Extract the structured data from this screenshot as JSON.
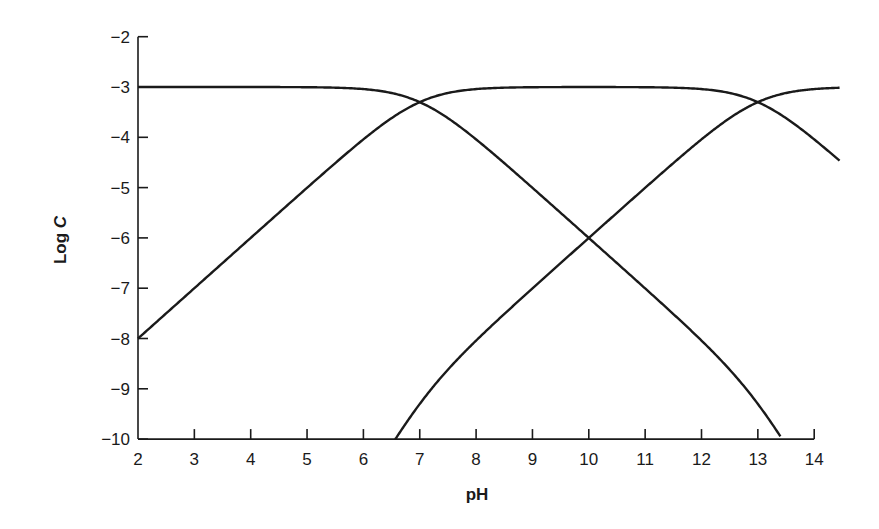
{
  "chart_data": {
    "type": "line",
    "title": "",
    "xlabel": "pH",
    "ylabel": "Log C",
    "ylabel_parts": {
      "plain": "Log ",
      "italic": "C"
    },
    "xlim": [
      2,
      14.45
    ],
    "ylim": [
      -10,
      -2
    ],
    "x_ticks": [
      2,
      3,
      4,
      5,
      6,
      7,
      8,
      9,
      10,
      11,
      12,
      13,
      14
    ],
    "x_tick_labels": [
      "2",
      "3",
      "4",
      "5",
      "6",
      "7",
      "8",
      "9",
      "10",
      "11",
      "12",
      "13",
      "14"
    ],
    "y_ticks": [
      -2,
      -3,
      -4,
      -5,
      -6,
      -7,
      -8,
      -9,
      -10
    ],
    "y_tick_labels": [
      "−2",
      "−3",
      "−4",
      "−5",
      "−6",
      "−7",
      "−8",
      "−9",
      "−10"
    ],
    "grid": false,
    "legend": null,
    "model": {
      "log_total_concentration": -3,
      "pKa1": 7,
      "pKa2": 13
    },
    "series": [
      {
        "name": "H2A (fully protonated)",
        "x": [
          2,
          4,
          5,
          6,
          6.5,
          7,
          7.5,
          8,
          9,
          10,
          11,
          12,
          12.5,
          13,
          13.4
        ],
        "values": [
          -3.0,
          -3.0,
          -3.0,
          -3.04,
          -3.12,
          -3.3,
          -3.62,
          -4.04,
          -5.0,
          -6.0,
          -7.0,
          -8.04,
          -8.62,
          -9.3,
          -9.95
        ]
      },
      {
        "name": "HA- (monoprotonated)",
        "x": [
          2,
          3,
          4,
          5,
          6,
          6.5,
          7,
          7.5,
          8,
          9,
          10,
          11,
          12,
          12.5,
          13,
          13.5,
          14,
          14.45
        ],
        "values": [
          -8.0,
          -7.0,
          -6.0,
          -5.0,
          -4.04,
          -3.62,
          -3.3,
          -3.12,
          -3.04,
          -3.0,
          -3.0,
          -3.0,
          -3.04,
          -3.12,
          -3.3,
          -3.62,
          -4.04,
          -4.49
        ]
      },
      {
        "name": "A2- (fully deprotonated)",
        "x": [
          6.56,
          7,
          7.5,
          8,
          9,
          10,
          11,
          12,
          12.5,
          13,
          13.5,
          14,
          14.45
        ],
        "values": [
          -10.0,
          -9.3,
          -8.62,
          -8.04,
          -7.0,
          -6.0,
          -5.0,
          -4.04,
          -3.62,
          -3.3,
          -3.12,
          -3.04,
          -3.01
        ]
      }
    ],
    "annotations": []
  }
}
